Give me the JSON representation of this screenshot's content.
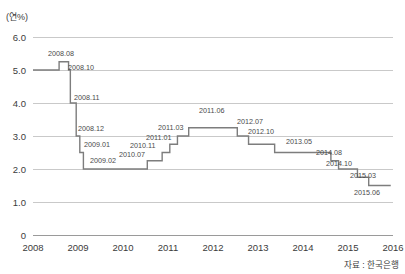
{
  "chart_data": {
    "type": "line",
    "subtype": "step",
    "title": "",
    "xlabel": "",
    "ylabel": "",
    "unit_label": "(연%)",
    "source_note": "자료 : 한국은행",
    "grid": true,
    "legend": "none",
    "xlim": [
      2008.0,
      2016.0
    ],
    "ylim": [
      0,
      6.0
    ],
    "yticks": [
      "0",
      "1.0",
      "2.0",
      "3.0",
      "4.0",
      "5.0",
      "6.0"
    ],
    "ytick_values": [
      0,
      1.0,
      2.0,
      3.0,
      4.0,
      5.0,
      6.0
    ],
    "xticks": [
      "2008",
      "2009",
      "2010",
      "2011",
      "2012",
      "2013",
      "2014",
      "2015",
      "2016"
    ],
    "xtick_values": [
      2008,
      2009,
      2010,
      2011,
      2012,
      2013,
      2014,
      2015,
      2016
    ],
    "series": [
      {
        "name": "기준금리",
        "color": "#7d7d7d",
        "points": [
          {
            "label": "",
            "x": 2008.0,
            "y": 5.0
          },
          {
            "label": "2008.08",
            "x": 2008.58,
            "y": 5.25
          },
          {
            "label": "2008.10",
            "x": 2008.79,
            "y": 5.0
          },
          {
            "label": "2008.11",
            "x": 2008.83,
            "y": 4.0
          },
          {
            "label": "2008.12",
            "x": 2008.96,
            "y": 3.0
          },
          {
            "label": "2009.01",
            "x": 2009.04,
            "y": 2.5
          },
          {
            "label": "2009.02",
            "x": 2009.12,
            "y": 2.0
          },
          {
            "label": "2010.07",
            "x": 2010.54,
            "y": 2.25
          },
          {
            "label": "2010.11",
            "x": 2010.87,
            "y": 2.5
          },
          {
            "label": "2011.01",
            "x": 2011.04,
            "y": 2.75
          },
          {
            "label": "2011.03",
            "x": 2011.21,
            "y": 3.0
          },
          {
            "label": "2011.06",
            "x": 2011.46,
            "y": 3.25
          },
          {
            "label": "2012.07",
            "x": 2012.54,
            "y": 3.0
          },
          {
            "label": "2012.10",
            "x": 2012.79,
            "y": 2.75
          },
          {
            "label": "2013.05",
            "x": 2013.37,
            "y": 2.5
          },
          {
            "label": "2014.08",
            "x": 2014.62,
            "y": 2.25
          },
          {
            "label": "2014.10",
            "x": 2014.79,
            "y": 2.0
          },
          {
            "label": "2015.03",
            "x": 2015.21,
            "y": 1.75
          },
          {
            "label": "2015.06",
            "x": 2015.46,
            "y": 1.5
          },
          {
            "label": "",
            "x": 2015.95,
            "y": 1.5
          }
        ]
      }
    ],
    "annotations": [
      {
        "text": "2008.08",
        "x": 48,
        "y": 56,
        "anchor": "start"
      },
      {
        "text": "2008.10",
        "x": 68,
        "y": 70,
        "anchor": "start"
      },
      {
        "text": "2008.11",
        "x": 74,
        "y": 100,
        "anchor": "start"
      },
      {
        "text": "2008.12",
        "x": 78,
        "y": 131,
        "anchor": "start"
      },
      {
        "text": "2009.01",
        "x": 84,
        "y": 147,
        "anchor": "start"
      },
      {
        "text": "2009.02",
        "x": 90,
        "y": 163,
        "anchor": "start"
      },
      {
        "text": "2010.07",
        "x": 119,
        "y": 157,
        "anchor": "start"
      },
      {
        "text": "2010.11",
        "x": 130,
        "y": 148,
        "anchor": "start"
      },
      {
        "text": "2011.01",
        "x": 146,
        "y": 140,
        "anchor": "start"
      },
      {
        "text": "2011.03",
        "x": 158,
        "y": 130,
        "anchor": "start"
      },
      {
        "text": "2011.06",
        "x": 199,
        "y": 113,
        "anchor": "start"
      },
      {
        "text": "2012.07",
        "x": 237,
        "y": 124,
        "anchor": "start"
      },
      {
        "text": "2012.10",
        "x": 248,
        "y": 134,
        "anchor": "start"
      },
      {
        "text": "2013.05",
        "x": 286,
        "y": 144,
        "anchor": "start"
      },
      {
        "text": "2014.08",
        "x": 316,
        "y": 155,
        "anchor": "start"
      },
      {
        "text": "2014.10",
        "x": 326,
        "y": 166,
        "anchor": "start"
      },
      {
        "text": "2015.03",
        "x": 350,
        "y": 178,
        "anchor": "start"
      },
      {
        "text": "2015.06",
        "x": 354,
        "y": 195,
        "anchor": "start"
      }
    ]
  }
}
